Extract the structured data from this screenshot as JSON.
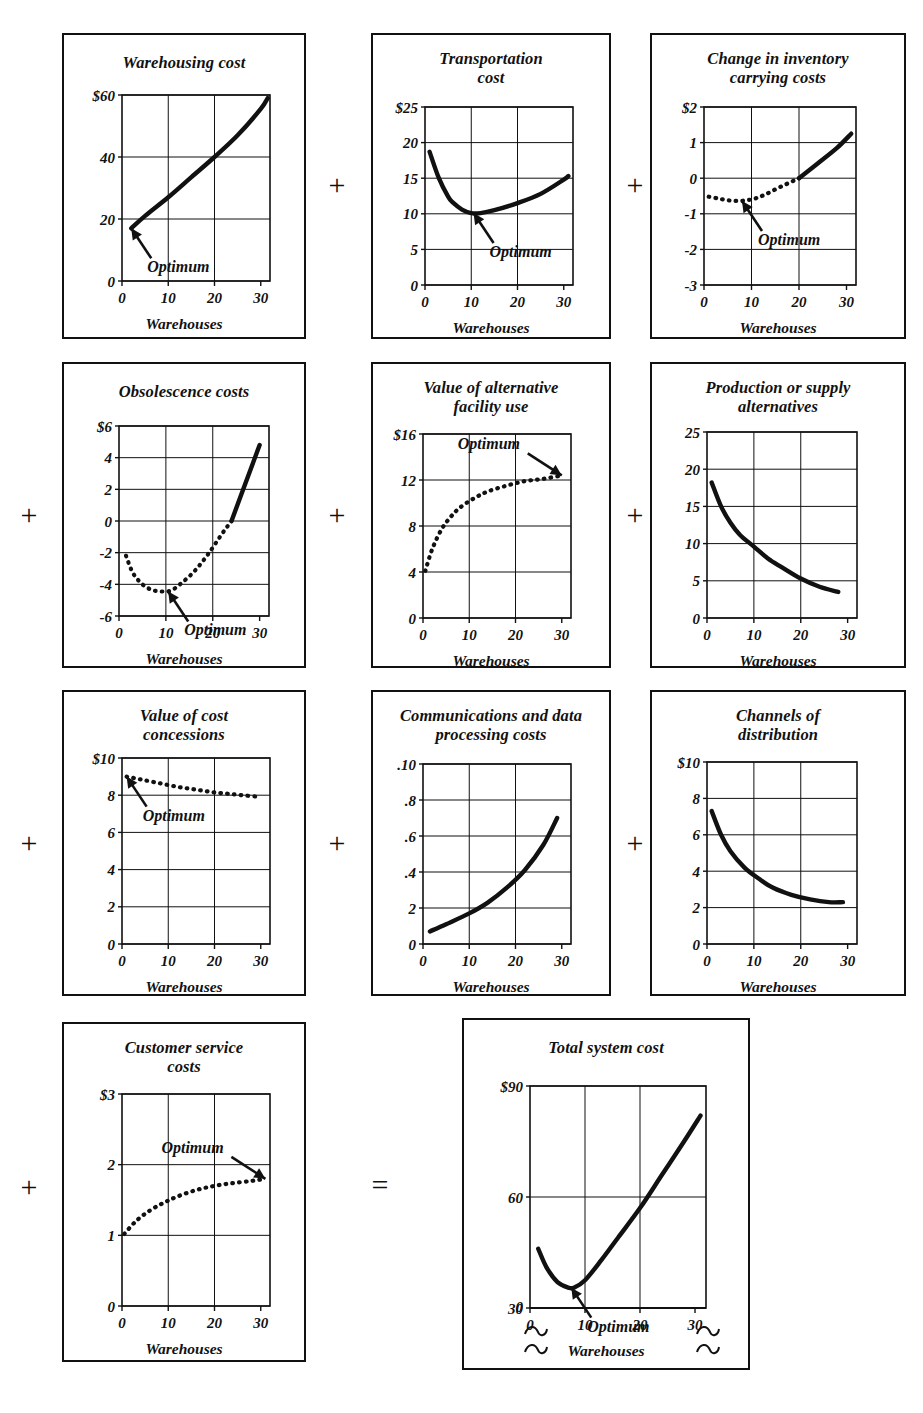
{
  "figure": {
    "shared_x_axis_label": "Warehouses",
    "optimum_label": "Optimum",
    "operator_plus": "+",
    "operator_equals": "="
  },
  "chart_data": [
    {
      "id": "warehousing-cost",
      "type": "line",
      "title": "Warehousing cost",
      "xlabel": "Warehouses",
      "ylabel": "",
      "xlim": [
        0,
        32
      ],
      "ylim": [
        0,
        60
      ],
      "xticks": [
        "0",
        "10",
        "20",
        "30"
      ],
      "yticks": [
        "0",
        "20",
        "40",
        "$60"
      ],
      "grid": true,
      "x": [
        2,
        5,
        10,
        15,
        20,
        25,
        30,
        31.5
      ],
      "values": [
        17,
        21,
        27,
        33.5,
        40,
        47,
        55.5,
        59
      ],
      "style": "solid",
      "annotation": {
        "text": "Optimum",
        "x": 2,
        "y": 17
      }
    },
    {
      "id": "transportation-cost",
      "type": "line",
      "title": "Transportation cost",
      "title_lines": [
        "Transportation",
        "cost"
      ],
      "xlabel": "Warehouses",
      "ylabel": "",
      "xlim": [
        0,
        32
      ],
      "ylim": [
        0,
        25
      ],
      "xticks": [
        "0",
        "10",
        "20",
        "30"
      ],
      "yticks": [
        "0",
        "5",
        "10",
        "15",
        "20",
        "$25"
      ],
      "grid": true,
      "x": [
        1,
        3,
        5,
        6,
        8,
        10,
        12,
        15,
        20,
        25,
        30,
        31
      ],
      "values": [
        18.7,
        15.0,
        12.4,
        11.6,
        10.6,
        10.1,
        10.1,
        10.5,
        11.5,
        12.8,
        14.8,
        15.3
      ],
      "style": "solid",
      "annotation": {
        "text": "Optimum",
        "x": 10.5,
        "y": 10.1
      }
    },
    {
      "id": "change-in-inventory-carrying-costs",
      "type": "line",
      "title": "Change in inventory carrying costs",
      "title_lines": [
        "Change in inventory",
        "carrying costs"
      ],
      "xlabel": "Warehouses",
      "ylabel": "",
      "xlim": [
        0,
        32
      ],
      "ylim": [
        -3,
        2
      ],
      "xticks": [
        "0",
        "10",
        "20",
        "30"
      ],
      "yticks": [
        "-3",
        "-2",
        "-1",
        "0",
        "1",
        "$2"
      ],
      "grid": true,
      "x": [
        1,
        3,
        5,
        7,
        9,
        11,
        13,
        16,
        20,
        24,
        28,
        31
      ],
      "values": [
        -0.52,
        -0.57,
        -0.62,
        -0.64,
        -0.62,
        -0.56,
        -0.45,
        -0.25,
        0.0,
        0.42,
        0.85,
        1.25
      ],
      "style": "dotted-then-solid",
      "solid_from_x": 20,
      "annotation": {
        "text": "Optimum",
        "x": 8,
        "y": -0.64
      }
    },
    {
      "id": "obsolescence-costs",
      "type": "line",
      "title": "Obsolescence costs",
      "xlabel": "Warehouses",
      "ylabel": "",
      "xlim": [
        0,
        32
      ],
      "ylim": [
        -6,
        6
      ],
      "xticks": [
        "0",
        "10",
        "20",
        "30"
      ],
      "yticks": [
        "-6",
        "-4",
        "-2",
        "0",
        "2",
        "4",
        "$6"
      ],
      "grid": true,
      "x": [
        1.5,
        3,
        5,
        7,
        9,
        11,
        13,
        16,
        19,
        22,
        24,
        27,
        30
      ],
      "values": [
        -2.2,
        -3.3,
        -4.0,
        -4.35,
        -4.45,
        -4.4,
        -4.0,
        -3.2,
        -2.1,
        -0.8,
        0.0,
        2.4,
        4.8
      ],
      "style": "dotted-then-solid",
      "solid_from_x": 24,
      "annotation": {
        "text": "Optimum",
        "x": 10.5,
        "y": -4.45
      }
    },
    {
      "id": "value-of-alternative-facility-use",
      "type": "line",
      "title": "Value of alternative facility use",
      "title_lines": [
        "Value of alternative",
        "facility use"
      ],
      "xlabel": "Warehouses",
      "ylabel": "",
      "xlim": [
        0,
        32
      ],
      "ylim": [
        0,
        16
      ],
      "xticks": [
        "0",
        "10",
        "20",
        "30"
      ],
      "yticks": [
        "0",
        "4",
        "8",
        "12",
        "$16"
      ],
      "grid": true,
      "x": [
        0.5,
        2,
        4,
        6,
        8,
        11,
        14,
        18,
        22,
        26,
        30
      ],
      "values": [
        4.1,
        6.0,
        7.7,
        8.8,
        9.6,
        10.4,
        11.0,
        11.5,
        11.9,
        12.1,
        12.4
      ],
      "style": "dotted",
      "annotation": {
        "text": "Optimum",
        "x": 30,
        "y": 12.4,
        "arrow_from": "left"
      }
    },
    {
      "id": "production-or-supply-alternatives",
      "type": "line",
      "title": "Production or supply alternatives",
      "title_lines": [
        "Production or supply",
        "alternatives"
      ],
      "xlabel": "Warehouses",
      "ylabel": "",
      "xlim": [
        0,
        32
      ],
      "ylim": [
        0,
        25
      ],
      "xticks": [
        "0",
        "10",
        "20",
        "30"
      ],
      "yticks": [
        "0",
        "5",
        "10",
        "15",
        "20",
        "25"
      ],
      "grid": true,
      "x": [
        1,
        3,
        5,
        7,
        10,
        13,
        16,
        20,
        24,
        28
      ],
      "values": [
        18.2,
        15.0,
        12.8,
        11.2,
        9.6,
        8.0,
        6.8,
        5.3,
        4.2,
        3.5
      ],
      "style": "solid",
      "annotation": null
    },
    {
      "id": "value-of-cost-concessions",
      "type": "line",
      "title": "Value of cost concessions",
      "title_lines": [
        "Value of cost",
        "concessions"
      ],
      "xlabel": "Warehouses",
      "ylabel": "",
      "xlim": [
        0,
        32
      ],
      "ylim": [
        0,
        10
      ],
      "xticks": [
        "0",
        "10",
        "20",
        "30"
      ],
      "yticks": [
        "0",
        "2",
        "4",
        "6",
        "8",
        "$10"
      ],
      "grid": true,
      "x": [
        1,
        4,
        8,
        12,
        16,
        20,
        24,
        28,
        30
      ],
      "values": [
        9.0,
        8.85,
        8.65,
        8.45,
        8.3,
        8.15,
        8.05,
        7.95,
        7.9
      ],
      "style": "dotted",
      "annotation": {
        "text": "Optimum",
        "x": 1,
        "y": 9.0
      }
    },
    {
      "id": "communications-and-data-processing-costs",
      "type": "line",
      "title": "Communications and data processing costs",
      "title_lines": [
        "Communications and data",
        "processing costs"
      ],
      "xlabel": "Warehouses",
      "ylabel": "",
      "xlim": [
        0,
        32
      ],
      "ylim": [
        0,
        1.0
      ],
      "xticks": [
        "0",
        "10",
        "20",
        "30"
      ],
      "yticks": [
        "0",
        "2",
        ".4",
        ".6",
        ".8",
        ".10"
      ],
      "grid": true,
      "x": [
        1.5,
        5,
        10,
        14,
        18,
        22,
        26,
        29
      ],
      "values": [
        0.07,
        0.11,
        0.17,
        0.23,
        0.31,
        0.41,
        0.55,
        0.7
      ],
      "style": "solid",
      "annotation": null
    },
    {
      "id": "channels-of-distribution",
      "type": "line",
      "title": "Channels of distribution",
      "title_lines": [
        "Channels of",
        "distribution"
      ],
      "xlabel": "Warehouses",
      "ylabel": "",
      "xlim": [
        0,
        32
      ],
      "ylim": [
        0,
        10
      ],
      "xticks": [
        "0",
        "10",
        "20",
        "30"
      ],
      "yticks": [
        "0",
        "2",
        "4",
        "6",
        "8",
        "$10"
      ],
      "grid": true,
      "x": [
        1,
        3,
        5,
        8,
        11,
        14,
        18,
        22,
        26,
        29
      ],
      "values": [
        7.3,
        6.0,
        5.1,
        4.2,
        3.6,
        3.1,
        2.7,
        2.45,
        2.3,
        2.3
      ],
      "style": "solid",
      "annotation": null
    },
    {
      "id": "customer-service-costs",
      "type": "line",
      "title": "Customer service costs",
      "title_lines": [
        "Customer service",
        "costs"
      ],
      "xlabel": "Warehouses",
      "ylabel": "",
      "xlim": [
        0,
        32
      ],
      "ylim": [
        0,
        3
      ],
      "xticks": [
        "0",
        "10",
        "20",
        "30"
      ],
      "yticks": [
        "0",
        "1",
        "2",
        "$3"
      ],
      "grid": true,
      "x": [
        0.5,
        3,
        6,
        9,
        12,
        16,
        20,
        24,
        28,
        31
      ],
      "values": [
        1.02,
        1.2,
        1.35,
        1.46,
        1.55,
        1.64,
        1.7,
        1.74,
        1.77,
        1.8
      ],
      "style": "dotted",
      "annotation": {
        "text": "Optimum",
        "x": 31,
        "y": 1.8,
        "arrow_from": "left"
      }
    },
    {
      "id": "total-system-cost",
      "type": "line",
      "title": "Total system cost",
      "xlabel": "Warehouses",
      "ylabel": "",
      "xlim": [
        0,
        32
      ],
      "ylim": [
        30,
        90
      ],
      "xticks": [
        "0",
        "10",
        "20",
        "30"
      ],
      "yticks": [
        "0",
        "30",
        "60",
        "$90"
      ],
      "grid": true,
      "axis_break": true,
      "x": [
        1.5,
        3,
        5,
        7,
        8,
        10,
        13,
        16,
        20,
        24,
        28,
        31
      ],
      "values": [
        46,
        41,
        37,
        35.5,
        35.5,
        37.5,
        43,
        49,
        57,
        66,
        75,
        82
      ],
      "style": "solid",
      "annotation": {
        "text": "Optimum",
        "x": 7.5,
        "y": 35.5
      }
    }
  ],
  "operators": [
    {
      "id": "op-r1-c1",
      "symbol": "+"
    },
    {
      "id": "op-r1-c2",
      "symbol": "+"
    },
    {
      "id": "op-r2-c0",
      "symbol": "+"
    },
    {
      "id": "op-r2-c1",
      "symbol": "+"
    },
    {
      "id": "op-r2-c2",
      "symbol": "+"
    },
    {
      "id": "op-r3-c0",
      "symbol": "+"
    },
    {
      "id": "op-r3-c1",
      "symbol": "+"
    },
    {
      "id": "op-r3-c2",
      "symbol": "+"
    },
    {
      "id": "op-r4-c0",
      "symbol": "+"
    },
    {
      "id": "op-equals",
      "symbol": "="
    }
  ]
}
